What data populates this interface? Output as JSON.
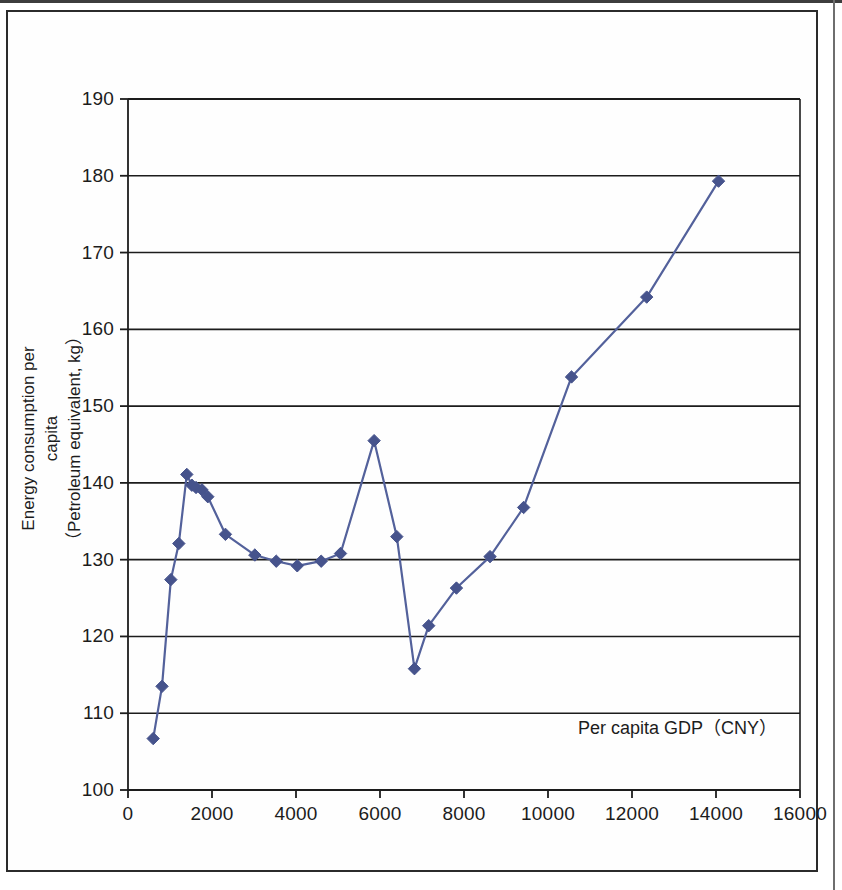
{
  "figure": {
    "y_axis_title": "Energy consumption per capita\n（Petroleum equivalent, kg）",
    "y_axis_title_line1": "Energy consumption per",
    "y_axis_title_line2": "capita",
    "y_axis_title_line3": "（Petroleum equivalent, kg）",
    "x_axis_annotation": "Per capita GDP（CNY）"
  },
  "chart_data": {
    "type": "line",
    "title": "",
    "subtitle": "",
    "xlabel": "Per capita GDP（CNY）",
    "ylabel": "Energy consumption per capita（Petroleum equivalent, kg）",
    "xlim": [
      0,
      16000
    ],
    "ylim": [
      100,
      190
    ],
    "xticks": [
      0,
      2000,
      4000,
      6000,
      8000,
      10000,
      12000,
      14000,
      16000
    ],
    "yticks": [
      100,
      110,
      120,
      130,
      140,
      150,
      160,
      170,
      180,
      190
    ],
    "xtick_labels": [
      "0",
      "2000",
      "4000",
      "6000",
      "8000",
      "10000",
      "12000",
      "14000",
      "16000"
    ],
    "ytick_labels": [
      "100",
      "110",
      "120",
      "130",
      "140",
      "150",
      "160",
      "170",
      "180",
      "190"
    ],
    "grid": "horizontal",
    "legend": "none",
    "marker": "diamond",
    "line_color": "#53619b",
    "marker_color": "#46538c",
    "axis_color": "#1c1c1c",
    "series": [
      {
        "name": "Energy consumption per capita",
        "points": [
          [
            600,
            106.7
          ],
          [
            810,
            113.5
          ],
          [
            1020,
            127.4
          ],
          [
            1210,
            132.1
          ],
          [
            1400,
            141.1
          ],
          [
            1520,
            139.7
          ],
          [
            1620,
            139.4
          ],
          [
            1760,
            139.1
          ],
          [
            1900,
            138.2
          ],
          [
            2320,
            133.3
          ],
          [
            3020,
            130.6
          ],
          [
            3530,
            129.8
          ],
          [
            4030,
            129.2
          ],
          [
            4600,
            129.8
          ],
          [
            5060,
            130.8
          ],
          [
            5860,
            145.5
          ],
          [
            6400,
            133.0
          ],
          [
            6820,
            115.8
          ],
          [
            7160,
            121.4
          ],
          [
            7820,
            126.3
          ],
          [
            8620,
            130.4
          ],
          [
            9420,
            136.8
          ],
          [
            10560,
            153.8
          ],
          [
            12350,
            164.2
          ],
          [
            14060,
            179.3
          ]
        ]
      }
    ]
  }
}
